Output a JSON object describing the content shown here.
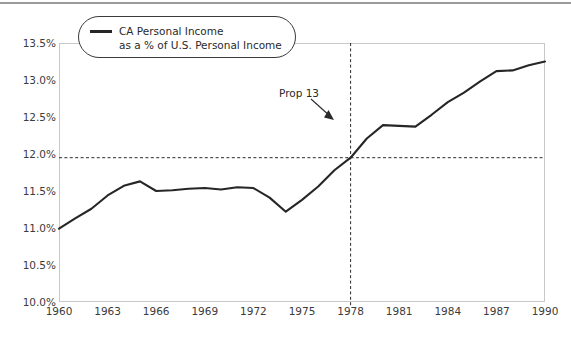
{
  "figure": {
    "background": "#ffffff",
    "frame_color": "#c8c8c8",
    "line_color": "#262626",
    "text_color": "#3b3b3b"
  },
  "legend": {
    "line1": "CA Personal Income",
    "line2": "as a % of U.S. Personal Income",
    "swatch_name": "line-swatch"
  },
  "annotation": {
    "label": "Prop 13",
    "year": 1978
  },
  "chart_data": {
    "type": "line",
    "title": "",
    "xlabel": "",
    "ylabel": "",
    "xlim": [
      1960,
      1990
    ],
    "ylim": [
      10.0,
      13.5
    ],
    "grid": false,
    "legend_position": "top-left",
    "xticks": [
      1960,
      1963,
      1966,
      1969,
      1972,
      1975,
      1978,
      1981,
      1984,
      1987,
      1990
    ],
    "xticklabels": [
      "1960",
      "1963",
      "1966",
      "1969",
      "1972",
      "1975",
      "1978",
      "1981",
      "1984",
      "1987",
      "1990"
    ],
    "yticks": [
      10.0,
      10.5,
      11.0,
      11.5,
      12.0,
      12.5,
      13.0,
      13.5
    ],
    "yticklabels": [
      "10.0%",
      "10.5%",
      "11.0%",
      "11.5%",
      "12.0%",
      "12.5%",
      "13.0%",
      "13.5%"
    ],
    "reference_lines": [
      {
        "orientation": "horizontal",
        "value": 11.95,
        "style": "dashed",
        "color": "#2a2a2a"
      },
      {
        "orientation": "vertical",
        "value": 1978,
        "style": "dashed",
        "color": "#2a2a2a"
      }
    ],
    "series": [
      {
        "name": "CA Personal Income as a % of U.S. Personal Income",
        "color": "#262626",
        "x": [
          1960,
          1961,
          1962,
          1963,
          1964,
          1965,
          1966,
          1967,
          1968,
          1969,
          1970,
          1971,
          1972,
          1973,
          1974,
          1975,
          1976,
          1977,
          1978,
          1979,
          1980,
          1981,
          1982,
          1983,
          1984,
          1985,
          1986,
          1987,
          1988,
          1989,
          1990
        ],
        "values": [
          10.99,
          11.13,
          11.26,
          11.44,
          11.57,
          11.63,
          11.5,
          11.51,
          11.53,
          11.54,
          11.52,
          11.55,
          11.54,
          11.41,
          11.22,
          11.38,
          11.56,
          11.78,
          11.95,
          12.21,
          12.39,
          12.38,
          12.37,
          12.53,
          12.7,
          12.83,
          12.98,
          13.12,
          13.13,
          13.2,
          13.25
        ]
      }
    ]
  }
}
